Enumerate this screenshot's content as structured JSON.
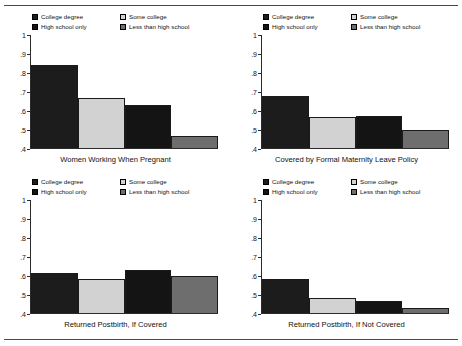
{
  "figure": {
    "rule_color": "#4a4a4a",
    "background": "#ffffff"
  },
  "legend": {
    "items": [
      {
        "label": "College degree",
        "color": "#1c1c1c"
      },
      {
        "label": "Some college",
        "color": "#d2d2d2"
      },
      {
        "label": "High school only",
        "color": "#141414"
      },
      {
        "label": "Less than high school",
        "color": "#6e6e6e"
      }
    ]
  },
  "axis": {
    "tick_labels": [
      "1",
      ".9",
      ".8",
      ".7",
      ".6",
      ".5",
      ".4"
    ],
    "ymin": 0.4,
    "ymax": 1.0
  },
  "chart_data": [
    {
      "type": "bar",
      "title": "Women Working When Pregnant",
      "xlabel": "",
      "ylabel": "",
      "ylim": [
        0.4,
        1.0
      ],
      "yticks": [
        0.4,
        0.5,
        0.6,
        0.7,
        0.8,
        0.9,
        1.0
      ],
      "ytick_labels": [
        ".4",
        ".5",
        ".6",
        ".7",
        ".8",
        ".9",
        "1"
      ],
      "grid": false,
      "legend_position": "top",
      "categories": [
        "College degree",
        "Some college",
        "High school only",
        "Less than high school"
      ],
      "values": [
        0.84,
        0.667,
        0.63,
        0.462
      ],
      "colors": [
        "#1c1c1c",
        "#d2d2d2",
        "#141414",
        "#6e6e6e"
      ]
    },
    {
      "type": "bar",
      "title": "Covered by Formal Maternity Leave Policy",
      "xlabel": "",
      "ylabel": "",
      "ylim": [
        0.4,
        1.0
      ],
      "yticks": [
        0.4,
        0.5,
        0.6,
        0.7,
        0.8,
        0.9,
        1.0
      ],
      "ytick_labels": [
        ".4",
        ".5",
        ".6",
        ".7",
        ".8",
        ".9",
        "1"
      ],
      "grid": false,
      "legend_position": "top",
      "categories": [
        "College degree",
        "Some college",
        "High school only",
        "Less than high school"
      ],
      "values": [
        0.675,
        0.563,
        0.568,
        0.497
      ],
      "colors": [
        "#1c1c1c",
        "#d2d2d2",
        "#141414",
        "#6e6e6e"
      ]
    },
    {
      "type": "bar",
      "title": "Returned Postbirth, If Covered",
      "xlabel": "",
      "ylabel": "",
      "ylim": [
        0.4,
        1.0
      ],
      "yticks": [
        0.4,
        0.5,
        0.6,
        0.7,
        0.8,
        0.9,
        1.0
      ],
      "ytick_labels": [
        ".4",
        ".5",
        ".6",
        ".7",
        ".8",
        ".9",
        "1"
      ],
      "grid": false,
      "legend_position": "top",
      "categories": [
        "College degree",
        "Some college",
        "High school only",
        "Less than high school"
      ],
      "values": [
        0.611,
        0.583,
        0.626,
        0.599
      ],
      "colors": [
        "#1c1c1c",
        "#d2d2d2",
        "#141414",
        "#6e6e6e"
      ]
    },
    {
      "type": "bar",
      "title": "Returned Postbirth, If Not Covered",
      "xlabel": "",
      "ylabel": "",
      "ylim": [
        0.4,
        1.0
      ],
      "yticks": [
        0.4,
        0.5,
        0.6,
        0.7,
        0.8,
        0.9,
        1.0
      ],
      "ytick_labels": [
        ".4",
        ".5",
        ".6",
        ".7",
        ".8",
        ".9",
        "1"
      ],
      "grid": false,
      "legend_position": "top",
      "categories": [
        "College degree",
        "Some college",
        "High school only",
        "Less than high school"
      ],
      "values": [
        0.578,
        0.478,
        0.465,
        0.429
      ],
      "colors": [
        "#1c1c1c",
        "#d2d2d2",
        "#141414",
        "#6e6e6e"
      ]
    }
  ]
}
